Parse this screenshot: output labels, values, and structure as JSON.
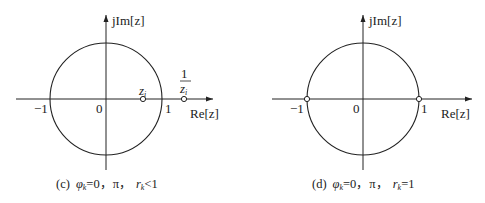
{
  "panels": [
    {
      "id": "c",
      "caption": "(c) φₖ=0，π， rₖ<1",
      "caption_parts": {
        "label": "(c)",
        "phi": "φ",
        "sub": "k",
        "eq": "=0，π，",
        "r": "r",
        "rsub": "k",
        "cond": "<1"
      },
      "axes": {
        "y_label": "jIm[z]",
        "x_label": "Re[z]"
      },
      "ticks": {
        "neg_one": "−1",
        "zero": "0",
        "one": "1"
      },
      "points": [
        {
          "name": "z_i",
          "label": "z",
          "sub": "i",
          "x": 0.65
        },
        {
          "name": "1/z_i",
          "num": "1",
          "den": "z",
          "densub": "i",
          "x": 1.4
        }
      ],
      "unit_circle": true
    },
    {
      "id": "d",
      "caption": "(d) φₖ=0，π， rₖ=1",
      "caption_parts": {
        "label": "(d)",
        "phi": "φ",
        "sub": "k",
        "eq": "=0，π，",
        "r": "r",
        "rsub": "k",
        "cond": "=1"
      },
      "axes": {
        "y_label": "jIm[z]",
        "x_label": "Re[z]"
      },
      "ticks": {
        "neg_one": "−1",
        "zero": "0",
        "one": "1"
      },
      "points": [
        {
          "name": "z=-1",
          "x": -1
        },
        {
          "name": "z=1",
          "x": 1
        }
      ],
      "unit_circle": true
    }
  ],
  "style": {
    "stroke": "#222222",
    "background": "#ffffff"
  }
}
